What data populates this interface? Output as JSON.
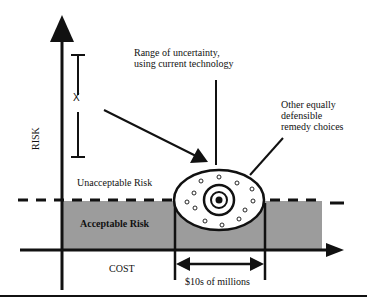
{
  "diagram": {
    "axes": {
      "y_label": "RISK",
      "x_label": "COST"
    },
    "regions": {
      "unacceptable": "Unacceptable Risk",
      "acceptable": "Acceptable Risk"
    },
    "annotations": {
      "x_marker": "X",
      "uncertainty": [
        "Range of uncertainty,",
        "using current technology"
      ],
      "alternatives": [
        "Other equally",
        "defensible",
        "remedy choices"
      ],
      "cost_range": "$10s of millions"
    },
    "colors": {
      "acceptable_fill": "#9a9a9a",
      "line": "#111111",
      "background": "#ffffff"
    }
  }
}
